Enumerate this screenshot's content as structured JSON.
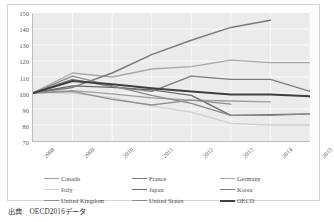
{
  "chart_data": {
    "type": "line",
    "title": "",
    "subtitle": "",
    "xlabel": "",
    "ylabel": "",
    "x": [
      "2008",
      "2009",
      "2010",
      "2011",
      "2012",
      "2013",
      "2014",
      "2015"
    ],
    "xlim": [
      2008,
      2015
    ],
    "ylim": [
      70,
      150
    ],
    "yticks": [
      70,
      80,
      90,
      100,
      110,
      120,
      130,
      140,
      150
    ],
    "xticks": [
      "2008",
      "2009",
      "2010",
      "2011",
      "2012",
      "2013",
      "2014",
      "2015"
    ],
    "grid": true,
    "grid_color": "#ffffff",
    "plot_background": "#ebebeb",
    "legend_position": "bottom",
    "index_base": 100,
    "series": [
      {
        "name": "Canada",
        "color": "#9e9e9e",
        "width": 1.3,
        "values": [
          100,
          101.5,
          99.5,
          97.0,
          95.5,
          95.0,
          94.5,
          null
        ]
      },
      {
        "name": "France",
        "color": "#7b7b7b",
        "width": 1.3,
        "values": [
          100,
          108.5,
          104.0,
          101.0,
          110.5,
          108.5,
          108.5,
          101.0
        ]
      },
      {
        "name": "Germany",
        "color": "#a8a8a8",
        "width": 1.3,
        "values": [
          100,
          112.5,
          110.0,
          115.0,
          116.5,
          120.5,
          119.0,
          119.0
        ]
      },
      {
        "name": "Italy",
        "color": "#cfcfcf",
        "width": 1.3,
        "values": [
          100,
          100.0,
          97.0,
          92.0,
          88.0,
          81.0,
          80.0,
          80.0
        ]
      },
      {
        "name": "Japan",
        "color": "#6b6b6b",
        "width": 1.3,
        "values": [
          100,
          104.5,
          103.5,
          102.0,
          98.5,
          86.0,
          86.5,
          87.0
        ]
      },
      {
        "name": "Korea",
        "color": "#7a7a7a",
        "width": 1.5,
        "values": [
          100,
          103.5,
          112.5,
          124.0,
          133.0,
          141.0,
          145.5,
          null
        ]
      },
      {
        "name": "United Kingdom",
        "color": "#8f8f8f",
        "width": 1.3,
        "values": [
          100,
          101.0,
          96.0,
          92.5,
          95.5,
          93.0,
          null,
          null
        ]
      },
      {
        "name": "United States",
        "color": "#8a8a8a",
        "width": 1.3,
        "values": [
          100,
          110.5,
          104.5,
          98.5,
          93.5,
          86.0,
          86.0,
          87.0
        ]
      },
      {
        "name": "OECD",
        "color": "#3f3f3f",
        "width": 2.0,
        "values": [
          100,
          107.5,
          105.5,
          103.0,
          101.0,
          99.0,
          99.0,
          98.0
        ]
      }
    ]
  },
  "legend": {
    "items": [
      {
        "label": "Canada",
        "color": "#9e9e9e",
        "thick": false
      },
      {
        "label": "France",
        "color": "#7b7b7b",
        "thick": false
      },
      {
        "label": "Germany",
        "color": "#a8a8a8",
        "thick": false
      },
      {
        "label": "Italy",
        "color": "#cfcfcf",
        "thick": false
      },
      {
        "label": "Japan",
        "color": "#6b6b6b",
        "thick": false
      },
      {
        "label": "Korea",
        "color": "#7a7a7a",
        "thick": false
      },
      {
        "label": "United Kingdom",
        "color": "#8f8f8f",
        "thick": false
      },
      {
        "label": "United States",
        "color": "#8a8a8a",
        "thick": false
      },
      {
        "label": "OECD",
        "color": "#3f3f3f",
        "thick": true
      }
    ]
  },
  "caption": {
    "source_label": "出典",
    "source_text": "OECD2016データ"
  }
}
